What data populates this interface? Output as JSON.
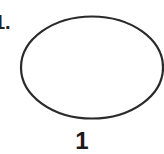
{
  "problem": {
    "number_label": "1.",
    "shape": "ellipse",
    "caption": "1"
  },
  "colors": {
    "stroke": "#2a2a2a",
    "background": "#ffffff"
  }
}
